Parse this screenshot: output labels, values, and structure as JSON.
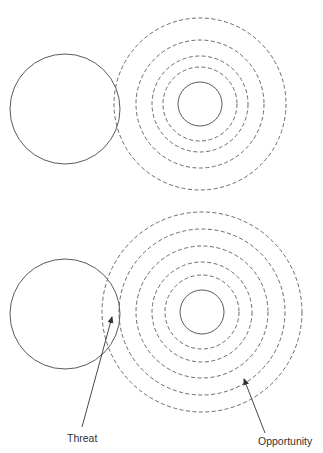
{
  "colors": {
    "stroke": "#5a5a5a",
    "text": "#333333",
    "background": "#ffffff"
  },
  "panels": [
    {
      "name": "top-panel",
      "left_circle": {
        "cx": 65,
        "cy": 109,
        "r": 55,
        "style": "solid"
      },
      "concentric_group": {
        "cx": 200,
        "cy": 104,
        "solid_radius": 22,
        "dashed_radii": [
          37,
          48,
          64,
          86
        ]
      }
    },
    {
      "name": "bottom-panel",
      "left_circle": {
        "cx": 65,
        "cy": 314,
        "r": 55,
        "style": "solid"
      },
      "concentric_group": {
        "cx": 202,
        "cy": 312,
        "solid_radius": 22,
        "dashed_radii": [
          37,
          50,
          66,
          83,
          100
        ]
      }
    }
  ],
  "annotations": {
    "threat": {
      "label": "Threat",
      "arrow": {
        "x1": 82,
        "y1": 427,
        "x2": 112,
        "y2": 317
      },
      "text_x": 67,
      "text_y": 442
    },
    "opportunity": {
      "label": "Opportunity",
      "arrow": {
        "x1": 265,
        "y1": 433,
        "x2": 244,
        "y2": 379
      },
      "text_x": 258,
      "text_y": 445
    }
  }
}
